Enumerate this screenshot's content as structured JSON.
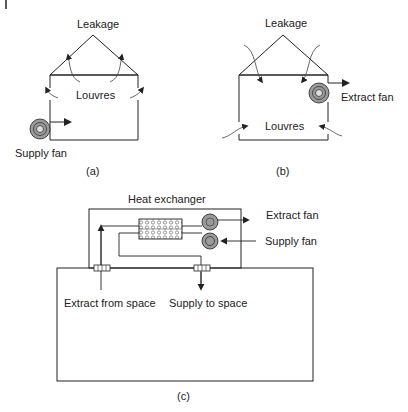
{
  "figure": {
    "panel_a": {
      "caption": "(a)",
      "labels": {
        "roof": "Leakage",
        "walls": "Louvres",
        "fan": "Supply fan"
      }
    },
    "panel_b": {
      "caption": "(b)",
      "labels": {
        "roof": "Leakage",
        "walls": "Louvres",
        "fan": "Extract fan"
      }
    },
    "panel_c": {
      "caption": "(c)",
      "labels": {
        "unit": "Heat exchanger",
        "extract_fan": "Extract fan",
        "supply_fan": "Supply fan",
        "extract_from_space": "Extract from space",
        "supply_to_space": "Supply to space"
      }
    }
  },
  "colors": {
    "line": "#222222",
    "fan_fill": "#9a9a9a",
    "background": "#ffffff"
  }
}
